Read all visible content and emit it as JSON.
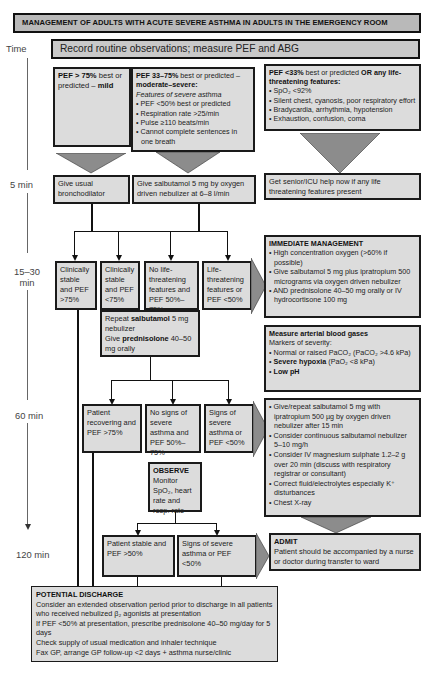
{
  "title": "MANAGEMENT OF ADULTS WITH ACUTE SEVERE ASTHMA IN ADULTS IN THE EMERGENCY ROOM",
  "record": "Record routine observations; measure PEF and ABG",
  "time_axis": {
    "label": "Time",
    "marks": [
      "5 min",
      "15–30 min",
      "60 min",
      "120 min"
    ]
  },
  "assessment": {
    "mild": {
      "bold": "PEF > 75%",
      "text": " best or predicted – ",
      "bold2": "mild"
    },
    "moderate": {
      "bold": "PEF 33–75%",
      "text": " best or predicted –",
      "bold2": "moderate–severe:",
      "italic": "Features of severe asthma",
      "items": [
        "PEF <50% best or predicted",
        "Respiration rate >25/min",
        "Pulse ≥110 beats/min",
        "Cannot complete sentences in one breath"
      ]
    },
    "life": {
      "bold": "PEF <33%",
      "text": " best or predicted ",
      "bold2": "OR any life-threatening features:",
      "items": [
        "SpO₂ <92%",
        "Silent chest, cyanosis, poor respiratory effort",
        "Bradycardia, arrhythmia, hypotension",
        "Exhaustion, confusion, coma"
      ]
    }
  },
  "five_min": {
    "mild": "Give usual bronchodilator",
    "moderate": "Give salbutamol 5 mg by oxygen driven nebulizer at 6–8 l/min",
    "life": "Get senior/ICU help now if any life threatening features present"
  },
  "fifteen_min": {
    "boxes": [
      "Clinically stable and PEF >75%",
      "Clinically stable and PEF <75%",
      "No life-threatening features and PEF 50%–75%",
      "Life-threatening features or PEF <50%"
    ],
    "repeat": {
      "t1": "Repeat ",
      "b1": "salbutamol",
      "t2": " 5 mg nebulizer",
      "t3": "Give ",
      "b2": "prednisolone",
      "t4": " 40–50 mg orally"
    }
  },
  "immediate": {
    "title": "IMMEDIATE MANAGEMENT",
    "items": [
      "High concentration oxygen (>60% if possible)",
      "Give salbutamol 5 mg plus ipratropium 500 micrograms via oxygen driven nebulizer",
      "AND prednisolone 40–50 mg orally or IV hydrocortisone 100 mg"
    ]
  },
  "abg": {
    "title": "Measure arterial blood gases",
    "subtitle": "Markers of severity:",
    "items": [
      "Normal or raised PaCO₂ (PaCO₂ >4.6 kPa)",
      "Severe hypoxia",
      " (PaO₂ <8 kPa)",
      "Low pH"
    ]
  },
  "sixty_min": {
    "boxes": [
      "Patient recovering and PEF >75%",
      "No signs of severe asthma and PEF 50%–75%",
      "Signs of severe asthma or PEF <50%"
    ],
    "observe_title": "OBSERVE",
    "observe_text": "Monitor SpO₂, heart rate and resp. rate"
  },
  "further": {
    "items": [
      "Give/repeat salbutamol 5 mg with ipratropium 500 µg by oxygen driven nebulizer after 15 min",
      "Consider continuous salbutamol nebulizer 5–10 mg/h",
      "Consider IV magnesium sulphate 1.2–2 g over 20 min (discuss with respiratory registrar or consultant)",
      "Correct fluid/electrolytes especially K⁺ disturbances",
      "Chest X-ray"
    ]
  },
  "onetwenty": {
    "boxes": [
      "Patient stable and PEF >50%",
      "Signs of severe asthma or PEF <50%"
    ]
  },
  "admit": {
    "title": "ADMIT",
    "text": "Patient should be accompanied by a nurse or doctor during transfer to ward"
  },
  "discharge": {
    "title": "POTENTIAL DISCHARGE",
    "lines": [
      "Consider an extended observation period prior to discharge in all patients who received nebulized β₂ agonists at presentation",
      "If PEF <50% at presentation, prescribe prednisolone 40–50 mg/day for 5 days",
      "Check supply of usual medication and inhaler technique",
      "Fax GP, arrange  GP follow-up <2 days + asthma nurse/clinic"
    ]
  },
  "colors": {
    "box": "#dcdcdc",
    "header": "#b9b9b9",
    "chevron": "#8c8c8c",
    "border": "#1a1a1a"
  }
}
